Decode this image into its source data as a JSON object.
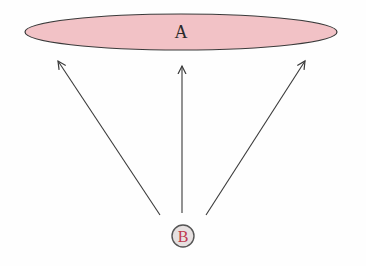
{
  "diagram": {
    "node_a": {
      "label": "A",
      "shape": "ellipse",
      "fill": "#f2c2c6",
      "stroke": "#3a3a3a"
    },
    "node_b": {
      "label": "B",
      "shape": "circle",
      "fill": "#e6e0e0",
      "stroke": "#555555",
      "text_color": "#c0394f"
    },
    "edges": [
      {
        "from": "B",
        "to": "A",
        "position": "left"
      },
      {
        "from": "B",
        "to": "A",
        "position": "center"
      },
      {
        "from": "B",
        "to": "A",
        "position": "right"
      }
    ],
    "arrow_color": "#3a3a3a"
  }
}
